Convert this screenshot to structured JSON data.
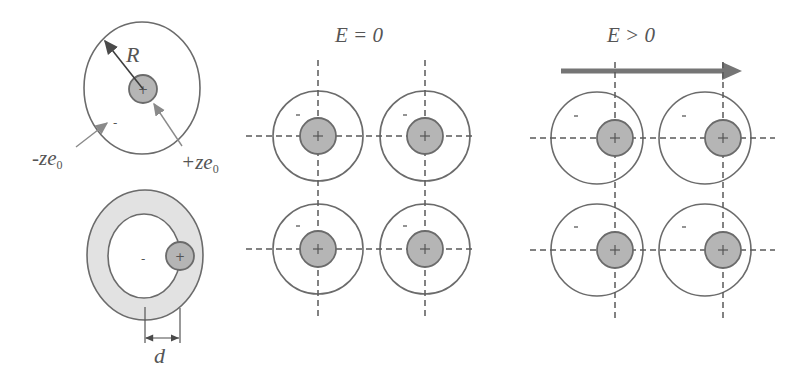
{
  "atom_isolated": {
    "radius_label": "R",
    "electron_charge_label": "-ze",
    "electron_charge_sub": "0",
    "nucleus_charge_label": "+ze",
    "nucleus_charge_sub": "0",
    "electron_sign": "-",
    "nucleus_sign": "+"
  },
  "atom_polarized": {
    "displacement_label": "d",
    "electron_sign": "-",
    "nucleus_sign": "+"
  },
  "lattice_no_field": {
    "title": "E = 0",
    "atoms": [
      {
        "cx": 318,
        "cy": 136,
        "ncx": 318
      },
      {
        "cx": 425,
        "cy": 136,
        "ncx": 425
      },
      {
        "cx": 318,
        "cy": 249,
        "ncx": 318
      },
      {
        "cx": 425,
        "cy": 249,
        "ncx": 425
      }
    ]
  },
  "lattice_with_field": {
    "title": "E > 0",
    "field_arrow_color": "#707070",
    "atoms": [
      {
        "cx": 597,
        "cy": 138,
        "ncx": 615
      },
      {
        "cx": 705,
        "cy": 138,
        "ncx": 723
      },
      {
        "cx": 597,
        "cy": 250,
        "ncx": 615
      },
      {
        "cx": 705,
        "cy": 250,
        "ncx": 723
      }
    ]
  },
  "colors": {
    "stroke": "#6b6b6b",
    "nucleus_fill": "#b5b5b5",
    "shell_fill": "#e2e2e2"
  }
}
